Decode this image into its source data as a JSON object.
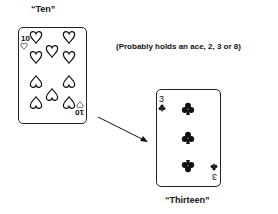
{
  "labels": {
    "top_card": "“Ten”",
    "bottom_card": "“Thirteen”",
    "annotation": "(Probably holds an ace, 2, 3 or 8)"
  },
  "cards": [
    {
      "name": "ten-of-hearts",
      "rank": "10",
      "suit": "hearts",
      "pips": 10
    },
    {
      "name": "three-of-clubs",
      "rank": "3",
      "suit": "clubs",
      "pips": 3
    }
  ],
  "arrow": {
    "from": [
      98,
      117
    ],
    "to": [
      148,
      142
    ]
  }
}
